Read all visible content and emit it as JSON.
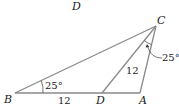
{
  "diagram": {
    "title_label": "D",
    "points": {
      "B": {
        "label": "B",
        "x": 15,
        "y": 93
      },
      "D": {
        "label": "D",
        "x": 102,
        "y": 93
      },
      "A": {
        "label": "A",
        "x": 140,
        "y": 93
      },
      "C": {
        "label": "C",
        "x": 156,
        "y": 26
      }
    },
    "segments": [
      {
        "from": "B",
        "to": "A"
      },
      {
        "from": "B",
        "to": "C"
      },
      {
        "from": "D",
        "to": "C"
      },
      {
        "from": "A",
        "to": "C"
      }
    ],
    "annotations": {
      "angle_B": "25°",
      "angle_DCA": "25°",
      "length_BD": "12",
      "length_DC": "12"
    },
    "colors": {
      "line": "#8a8a8a",
      "text": "#1a1a1a"
    }
  }
}
